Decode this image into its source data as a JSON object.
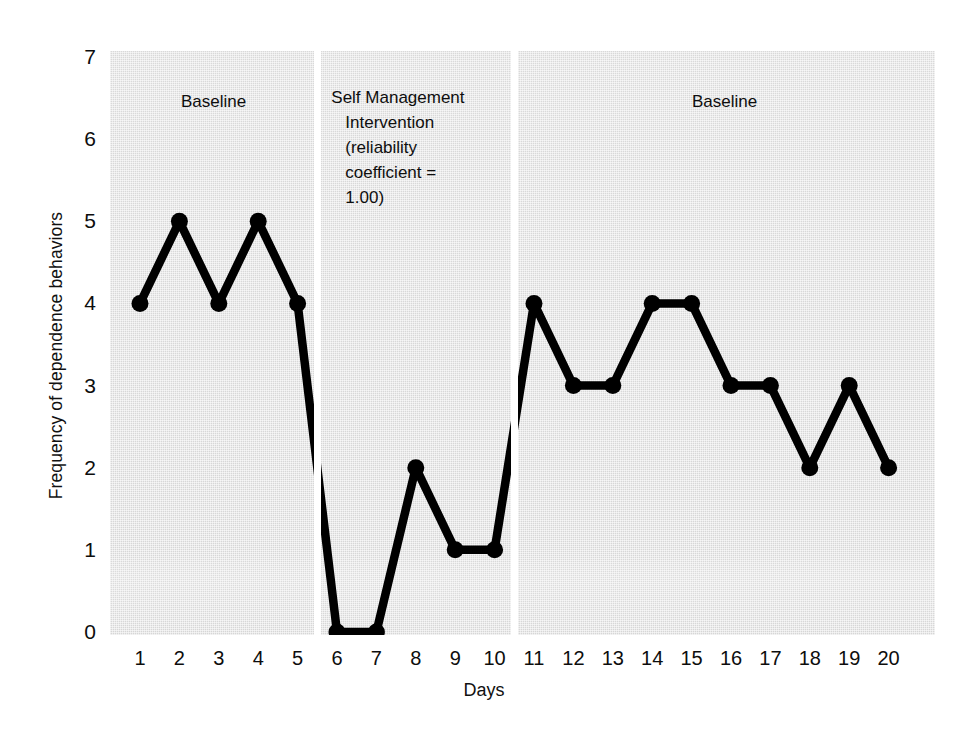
{
  "chart_data": {
    "type": "line",
    "title": "",
    "xlabel": "Days",
    "ylabel": "Frequency of dependence behaviors",
    "x": [
      1,
      2,
      3,
      4,
      5,
      6,
      7,
      8,
      9,
      10,
      11,
      12,
      13,
      14,
      15,
      16,
      17,
      18,
      19,
      20
    ],
    "values": [
      4,
      5,
      4,
      5,
      4,
      0,
      0,
      2,
      1,
      1,
      4,
      3,
      3,
      4,
      4,
      3,
      3,
      2,
      3,
      2
    ],
    "xlim": [
      0.25,
      20.75
    ],
    "ylim": [
      0,
      7
    ],
    "y_ticks": [
      "7",
      "6",
      "5",
      "4",
      "3",
      "2",
      "1",
      "0"
    ],
    "x_ticks": [
      "1",
      "2",
      "3",
      "4",
      "5",
      "6",
      "7",
      "8",
      "9",
      "10",
      "11",
      "12",
      "13",
      "14",
      "15",
      "16",
      "17",
      "18",
      "19",
      "20"
    ],
    "grid": false,
    "legend": "none",
    "marker": "filled-circle",
    "line_color": "#000000",
    "plot_background": "#d8d8d8",
    "phases": [
      {
        "name": "baseline-1",
        "label": "Baseline",
        "start_day": 1,
        "end_day": 5
      },
      {
        "name": "intervention",
        "label": "Self Management Intervention (reliability coefficient = 1.00)",
        "start_day": 6,
        "end_day": 10
      },
      {
        "name": "baseline-2",
        "label": "Baseline",
        "start_day": 11,
        "end_day": 20
      }
    ],
    "phase_breaks_after_day": [
      5,
      10
    ],
    "series_breaks": true,
    "annotations": [
      {
        "name": "phase-label-baseline-1",
        "text": "Baseline"
      },
      {
        "name": "phase-label-intervention-line-1",
        "text": "Self Management"
      },
      {
        "name": "phase-label-intervention-line-2",
        "text": "Intervention"
      },
      {
        "name": "phase-label-intervention-line-3",
        "text": "(reliability"
      },
      {
        "name": "phase-label-intervention-line-4",
        "text": "coefficient ="
      },
      {
        "name": "phase-label-intervention-line-5",
        "text": "1.00)"
      },
      {
        "name": "phase-label-baseline-2",
        "text": "Baseline"
      }
    ]
  },
  "axes": {
    "y_title": "Frequency of dependence behaviors",
    "x_title": "Days",
    "y_ticks": [
      "7",
      "6",
      "5",
      "4",
      "3",
      "2",
      "1",
      "0"
    ],
    "x_ticks": [
      "1",
      "2",
      "3",
      "4",
      "5",
      "6",
      "7",
      "8",
      "9",
      "10",
      "11",
      "12",
      "13",
      "14",
      "15",
      "16",
      "17",
      "18",
      "19",
      "20"
    ]
  },
  "phase_labels": {
    "baseline_1": "Baseline",
    "intervention_l1": "Self Management",
    "intervention_l2": "Intervention",
    "intervention_l3": "(reliability",
    "intervention_l4": "coefficient =",
    "intervention_l5": "1.00)",
    "baseline_2": "Baseline"
  }
}
